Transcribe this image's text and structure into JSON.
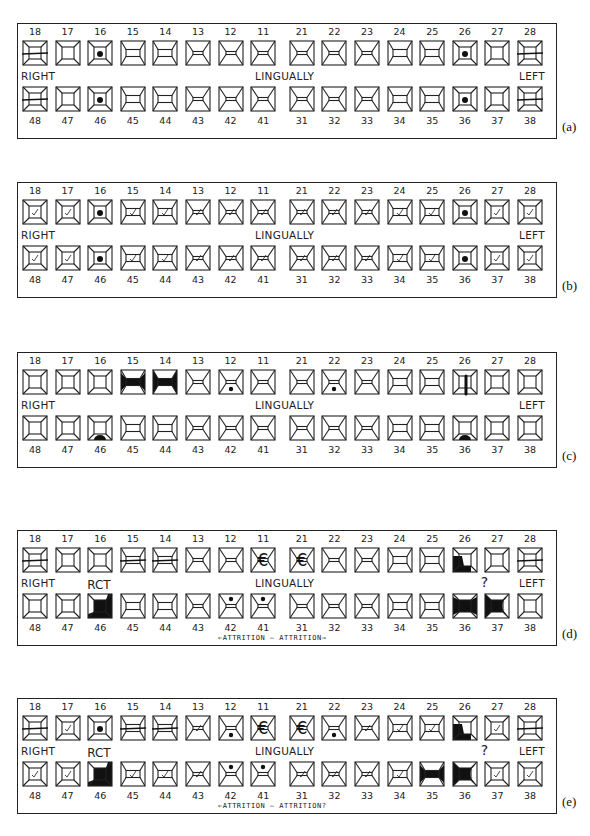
{
  "labels": {
    "right": "RIGHT",
    "left": "LEFT",
    "center": "LINGUALLY"
  },
  "upper_numbers": [
    "18",
    "17",
    "16",
    "15",
    "14",
    "13",
    "12",
    "11",
    "21",
    "22",
    "23",
    "24",
    "25",
    "26",
    "27",
    "28"
  ],
  "lower_numbers": [
    "48",
    "47",
    "46",
    "45",
    "44",
    "43",
    "42",
    "41",
    "31",
    "32",
    "33",
    "34",
    "35",
    "36",
    "37",
    "38"
  ],
  "upper_shapes": [
    "molar",
    "molar",
    "molar",
    "premolar",
    "premolar",
    "incisor",
    "incisor",
    "incisor",
    "incisor",
    "incisor",
    "incisor",
    "premolar",
    "premolar",
    "molar",
    "molar",
    "molar"
  ],
  "lower_shapes": [
    "molar",
    "molar",
    "molar",
    "premolar",
    "premolar",
    "incisor",
    "incisor",
    "incisor",
    "incisor",
    "incisor",
    "incisor",
    "premolar",
    "premolar",
    "molar",
    "molar",
    "molar"
  ],
  "panels": [
    {
      "id": "a",
      "label": "(a)",
      "top": 23,
      "upper_marks": [
        "missing",
        "",
        "dot",
        "",
        "",
        "",
        "",
        "",
        "",
        "",
        "",
        "",
        "",
        "dot",
        "",
        "missing"
      ],
      "lower_marks": [
        "missing",
        "",
        "dot",
        "",
        "",
        "",
        "",
        "",
        "",
        "",
        "",
        "",
        "",
        "dot",
        "",
        "missing"
      ],
      "notes": []
    },
    {
      "id": "b",
      "label": "(b)",
      "top": 182,
      "upper_marks": [
        "check",
        "check",
        "dot",
        "check",
        "check",
        "check",
        "check",
        "check",
        "check",
        "check",
        "check",
        "check",
        "check",
        "dot",
        "check",
        "check"
      ],
      "lower_marks": [
        "check",
        "check",
        "dot",
        "check",
        "check",
        "check",
        "check",
        "check",
        "check",
        "check",
        "check",
        "check",
        "check",
        "dot",
        "check",
        "check"
      ],
      "notes": []
    },
    {
      "id": "c",
      "label": "(c)",
      "top": 352,
      "upper_marks": [
        "",
        "",
        "",
        "bar-fill",
        "bar-fill-full",
        "",
        "dot-low",
        "",
        "",
        "dot-low",
        "",
        "",
        "",
        "post",
        "",
        ""
      ],
      "lower_marks": [
        "",
        "",
        "arc-bottom",
        "",
        "",
        "",
        "",
        "",
        "",
        "",
        "",
        "",
        "",
        "arc-bottom",
        "",
        ""
      ],
      "notes": []
    },
    {
      "id": "d",
      "label": "(d)",
      "top": 530,
      "upper_marks": [
        "missing",
        "",
        "",
        "missing",
        "missing",
        "",
        "",
        "euro",
        "euro",
        "",
        "",
        "",
        "",
        "corner-fill",
        "",
        "missing"
      ],
      "lower_marks": [
        "",
        "",
        "rct",
        "",
        "",
        "",
        "dot-top",
        "dot-top",
        "",
        "",
        "",
        "",
        "",
        "bar-fill",
        "bar-arc",
        ""
      ],
      "notes": [
        {
          "text": "RCT",
          "tooth_index": 2
        },
        {
          "text": "?",
          "tooth_index": 13
        }
      ],
      "attrition": "←ATTRITION — ATTRITION→"
    },
    {
      "id": "e",
      "label": "(e)",
      "top": 698,
      "upper_marks": [
        "missing",
        "check",
        "dot",
        "missing",
        "missing",
        "check",
        "dot-low",
        "euro",
        "euro",
        "dot-low",
        "check",
        "check",
        "check",
        "corner-fill",
        "check",
        "missing"
      ],
      "lower_marks": [
        "check",
        "check",
        "rct",
        "check",
        "check",
        "check",
        "dot-top",
        "dot-top",
        "check",
        "check",
        "check",
        "check",
        "bar-fill",
        "bar-arc",
        "check",
        "check"
      ],
      "notes": [
        {
          "text": "RCT",
          "tooth_index": 2
        },
        {
          "text": "?",
          "tooth_index": 13
        }
      ],
      "attrition": "←ATTRITION — ATTRITION?"
    }
  ]
}
